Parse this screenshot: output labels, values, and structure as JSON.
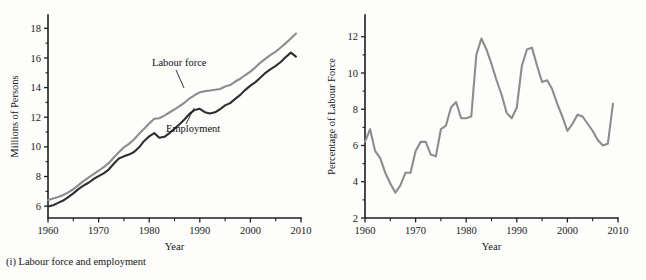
{
  "figure": {
    "panels": [
      {
        "id": "labour-force-employment",
        "caption": "(i) Labour force and employment",
        "xlabel": "Year",
        "ylabel": "Millions of Persons"
      },
      {
        "id": "unemployment-rate",
        "caption": "(ii) Unemployment rate",
        "xlabel": "Year",
        "ylabel": "Percentage of Labour Force"
      }
    ],
    "colors": {
      "labour_force": "#8d8d8d",
      "employment": "#2f2f2f",
      "unemployment": "#8d8d8d",
      "axis": "#1f1f1f",
      "background": "#fdfdfc"
    }
  },
  "chart_data": [
    {
      "type": "line",
      "title": "",
      "panel_caption": "(i) Labour force and employment",
      "xlabel": "Year",
      "ylabel": "Millions of Persons",
      "xlim": [
        1960,
        2010
      ],
      "ylim": [
        5.2,
        18.9
      ],
      "grid": false,
      "legend": "inline-annotations",
      "xticks": [
        1960,
        1970,
        1980,
        1990,
        2000,
        2010
      ],
      "xticks_minor": [
        1965,
        1975,
        1985,
        1995,
        2005
      ],
      "yticks": [
        6,
        8,
        10,
        12,
        14,
        16,
        18
      ],
      "x": [
        1960,
        1961,
        1962,
        1963,
        1964,
        1965,
        1966,
        1967,
        1968,
        1969,
        1970,
        1971,
        1972,
        1973,
        1974,
        1975,
        1976,
        1977,
        1978,
        1979,
        1980,
        1981,
        1982,
        1983,
        1984,
        1985,
        1986,
        1987,
        1988,
        1989,
        1990,
        1991,
        1992,
        1993,
        1994,
        1995,
        1996,
        1997,
        1998,
        1999,
        2000,
        2001,
        2002,
        2003,
        2004,
        2005,
        2006,
        2007,
        2008,
        2009
      ],
      "series": [
        {
          "name": "Labour force",
          "color": "#8d8d8d",
          "values": [
            6.41,
            6.52,
            6.62,
            6.75,
            6.93,
            7.14,
            7.42,
            7.69,
            7.92,
            8.16,
            8.39,
            8.64,
            8.9,
            9.28,
            9.64,
            9.97,
            10.2,
            10.5,
            10.88,
            11.23,
            11.57,
            11.9,
            11.93,
            12.11,
            12.32,
            12.53,
            12.75,
            12.99,
            13.28,
            13.5,
            13.68,
            13.76,
            13.8,
            13.85,
            13.91,
            14.07,
            14.17,
            14.41,
            14.6,
            14.85,
            15.08,
            15.37,
            15.69,
            15.96,
            16.21,
            16.43,
            16.71,
            17.0,
            17.31,
            17.65
          ],
          "values_note": "Millions of persons in labour force, 1960-2009; rises roughly linearly from 6.4M to ~18.4M at the right edge"
        },
        {
          "name": "Employment",
          "color": "#2f2f2f",
          "values": [
            5.97,
            6.06,
            6.22,
            6.38,
            6.61,
            6.86,
            7.15,
            7.38,
            7.58,
            7.83,
            8.03,
            8.21,
            8.47,
            8.86,
            9.21,
            9.36,
            9.48,
            9.65,
            9.97,
            10.4,
            10.71,
            10.93,
            10.62,
            10.68,
            10.93,
            11.22,
            11.53,
            11.86,
            12.24,
            12.49,
            12.57,
            12.34,
            12.25,
            12.33,
            12.54,
            12.8,
            12.95,
            13.24,
            13.51,
            13.85,
            14.13,
            14.37,
            14.68,
            15.0,
            15.25,
            15.47,
            15.73,
            16.06,
            16.36,
            16.09
          ],
          "values_note": "Millions employed, 1960-2009; tracks labour force below it with dips at 1982-83, 1991-93, 2009"
        }
      ],
      "annotations": [
        {
          "text": "Labour force",
          "for_series": "Labour force"
        },
        {
          "text": "Employment",
          "for_series": "Employment"
        }
      ]
    },
    {
      "type": "line",
      "title": "",
      "panel_caption": "(ii) Unemployment rate",
      "xlabel": "Year",
      "ylabel": "Percentage of Labour Force",
      "xlim": [
        1960,
        2010
      ],
      "ylim": [
        2,
        13.2
      ],
      "grid": false,
      "legend": "none",
      "xticks": [
        1960,
        1970,
        1980,
        1990,
        2000,
        2010
      ],
      "xticks_minor": [
        1965,
        1975,
        1985,
        1995,
        2005
      ],
      "yticks": [
        2,
        4,
        6,
        8,
        10,
        12
      ],
      "x": [
        1960,
        1961,
        1962,
        1963,
        1964,
        1965,
        1966,
        1967,
        1968,
        1969,
        1970,
        1971,
        1972,
        1973,
        1974,
        1975,
        1976,
        1977,
        1978,
        1979,
        1980,
        1981,
        1982,
        1983,
        1984,
        1985,
        1986,
        1987,
        1988,
        1989,
        1990,
        1991,
        1992,
        1993,
        1994,
        1995,
        1996,
        1997,
        1998,
        1999,
        2000,
        2001,
        2002,
        2003,
        2004,
        2005,
        2006,
        2007,
        2008,
        2009
      ],
      "series": [
        {
          "name": "Unemployment rate",
          "color": "#8d8d8d",
          "values": [
            6.2,
            6.9,
            5.7,
            5.3,
            4.5,
            3.9,
            3.4,
            3.8,
            4.5,
            4.5,
            5.7,
            6.2,
            6.2,
            5.5,
            5.4,
            6.9,
            7.1,
            8.1,
            8.4,
            7.5,
            7.5,
            7.6,
            11.0,
            11.9,
            11.3,
            10.5,
            9.6,
            8.8,
            7.8,
            7.5,
            8.1,
            10.4,
            11.3,
            11.4,
            10.4,
            9.5,
            9.6,
            9.1,
            8.3,
            7.6,
            6.8,
            7.2,
            7.7,
            7.6,
            7.2,
            6.8,
            6.3,
            6.0,
            6.1,
            8.3
          ],
          "values_note": "Unemployment as percentage of labour force 1960-2009; troughs near 3.4% (1966) and peaks near 11.9% (1983) and 11.3-11.4% (1992-93)"
        }
      ],
      "annotations": []
    }
  ]
}
